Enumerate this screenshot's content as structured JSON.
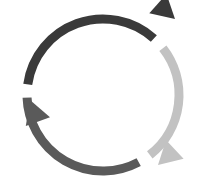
{
  "diagram": {
    "name": "three-stage-cycle-diagram",
    "type": "circular-cycle",
    "background_color": "#ffffff",
    "canvas": {
      "width": 204,
      "height": 194
    },
    "geometry": {
      "center_x": 103,
      "center_y": 95,
      "radius": 76,
      "stroke_width": 9,
      "direction": "clockwise"
    },
    "segments": [
      {
        "id": "segment-dark",
        "label": "dark-arc",
        "color": "#3a3a3a",
        "start_angle_deg": 188,
        "end_angle_deg": 312,
        "sweep_deg": 124,
        "arrow": {
          "id": "arrowhead-dark",
          "position": "upper-right",
          "clock_position": "1-2 o'clock",
          "tip_x": 175,
          "tip_y": 19,
          "direction_deg": 42,
          "size": 23
        },
        "tail": {
          "x": 27,
          "y": 84,
          "clock_position": "9 o'clock"
        }
      },
      {
        "id": "segment-light",
        "label": "light-gray-arc",
        "color": "#c2c2c2",
        "start_angle_deg": 322,
        "end_angle_deg": 52,
        "sweep_deg": 90,
        "arrow": {
          "id": "arrowhead-light",
          "position": "lower-right",
          "clock_position": "5 o'clock",
          "tip_x": 158,
          "tip_y": 165,
          "direction_deg": 137,
          "size": 23
        },
        "tail": {
          "x": 163,
          "y": 32,
          "clock_position": "1-2 o'clock"
        }
      },
      {
        "id": "segment-medium",
        "label": "medium-gray-arc",
        "color": "#5a5a5a",
        "start_angle_deg": 62,
        "end_angle_deg": 178,
        "sweep_deg": 116,
        "arrow": {
          "id": "arrowhead-medium",
          "position": "left",
          "clock_position": "9-10 o'clock",
          "tip_x": 30,
          "tip_y": 100,
          "direction_deg": 250,
          "size": 23
        },
        "tail": {
          "x": 159,
          "y": 160,
          "clock_position": "4-5 o'clock"
        }
      }
    ]
  }
}
